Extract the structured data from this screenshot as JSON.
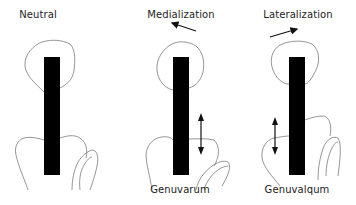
{
  "diagram": {
    "panels": [
      {
        "id": "neutral",
        "title": "Neutral",
        "caption": "",
        "motion_arrow": null,
        "has_double_arrow": false
      },
      {
        "id": "medialization",
        "title": "Medialization",
        "caption": "Genuvarum",
        "motion_arrow": "left-up",
        "has_double_arrow": true
      },
      {
        "id": "lateralization",
        "title": "Lateralization",
        "caption": "Genuvalqum",
        "motion_arrow": "right-up",
        "has_double_arrow": true
      }
    ],
    "colors": {
      "bar": "#000000",
      "outline": "#7a7a7a",
      "arrow": "#111111",
      "text": "#222222"
    }
  }
}
